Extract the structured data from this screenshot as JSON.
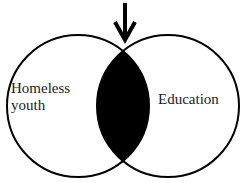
{
  "diagram": {
    "type": "venn",
    "sets": [
      {
        "label_line1": "Homeless",
        "label_line2": "youth"
      },
      {
        "label": "Education"
      }
    ],
    "intersection_fill": "#000000",
    "arrow": "down-arrow pointing at intersection"
  }
}
